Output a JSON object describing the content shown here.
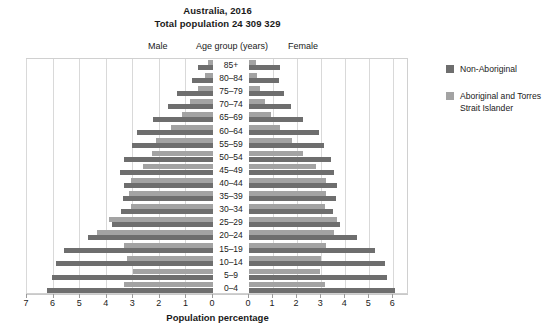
{
  "chart_data": {
    "type": "bar",
    "subtype": "population-pyramid",
    "title": "Australia, 2016",
    "subtitle": "Total population 24 309 329",
    "xlabel": "Population percentage",
    "ylabel": "Age group (years)",
    "left_side_label": "Male",
    "right_side_label": "Female",
    "center_label": "Age group (years)",
    "grid": true,
    "legend_position": "right",
    "xlim_left": [
      0,
      7
    ],
    "xlim_right": [
      0,
      7
    ],
    "xticks_left": [
      "7",
      "6",
      "5",
      "4",
      "3",
      "2",
      "1",
      "0"
    ],
    "xticks_right": [
      "0",
      "1",
      "2",
      "3",
      "4",
      "5",
      "6",
      "7"
    ],
    "categories": [
      "85+",
      "80–84",
      "75–79",
      "70–74",
      "65–69",
      "60–64",
      "55–59",
      "50–54",
      "45–49",
      "40–44",
      "35–39",
      "30–34",
      "25–29",
      "20–24",
      "15–19",
      "10–14",
      "5–9",
      "0–4"
    ],
    "series": [
      {
        "name": "Non-Aboriginal",
        "color": "#6e6e6e",
        "male": [
          0.55,
          0.8,
          1.35,
          1.7,
          2.25,
          2.85,
          3.05,
          3.35,
          3.5,
          3.35,
          3.4,
          3.45,
          3.8,
          4.7,
          5.6,
          5.9,
          6.05,
          6.25
        ],
        "female": [
          1.3,
          1.25,
          1.45,
          1.75,
          2.25,
          2.9,
          3.1,
          3.4,
          3.55,
          3.65,
          3.6,
          3.5,
          3.8,
          4.5,
          5.25,
          5.65,
          5.75,
          6.05
        ]
      },
      {
        "name": "Aboriginal and Torres Strait Islander",
        "color": "#a3a3a3",
        "male": [
          0.2,
          0.32,
          0.55,
          0.85,
          1.15,
          1.6,
          2.15,
          2.3,
          2.65,
          3.1,
          3.15,
          3.1,
          3.9,
          4.35,
          3.35,
          3.25,
          3.0,
          3.35
        ],
        "female": [
          0.3,
          0.33,
          0.45,
          0.65,
          0.9,
          1.3,
          1.8,
          2.25,
          2.8,
          3.2,
          3.2,
          3.15,
          3.65,
          3.55,
          3.2,
          3.0,
          2.95,
          3.15
        ]
      }
    ]
  },
  "legend": {
    "items": [
      {
        "label": "Non-Aboriginal",
        "color": "#6e6e6e"
      },
      {
        "label": "Aboriginal and Torres Strait Islander",
        "color": "#a3a3a3"
      }
    ]
  }
}
